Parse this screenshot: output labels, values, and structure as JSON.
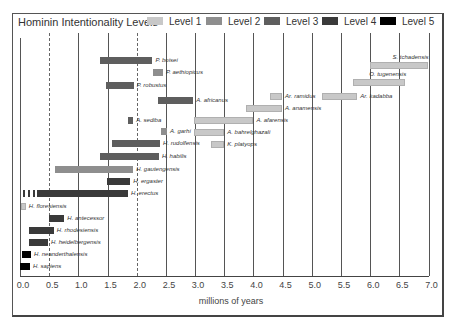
{
  "chart_data": {
    "type": "bar",
    "subtype": "horizontal-range (timeline)",
    "title": "Hominin Intentionality Levels",
    "xlabel": "millions of years",
    "ylabel": "",
    "xlim": [
      0.0,
      7.0
    ],
    "x_ticks": [
      "0.0",
      "0.5",
      "1.0",
      "1.5",
      "2.0",
      "2.5",
      "3.0",
      "3.5",
      "4.0",
      "4.5",
      "5.0",
      "5.5",
      "6.0",
      "6.5",
      "7.0"
    ],
    "grid": "vertical lines at each 0.5 Ma",
    "legend": [
      {
        "label": "Level 1",
        "color": "#c8c8c8"
      },
      {
        "label": "Level 2",
        "color": "#8e8e8e"
      },
      {
        "label": "Level 3",
        "color": "#5e5e5e"
      },
      {
        "label": "Level 4",
        "color": "#3a3a3a"
      },
      {
        "label": "Level 5",
        "color": "#000000"
      }
    ],
    "legend_position": "top, inline with title",
    "series": [
      {
        "name": "S. tchadensis",
        "start": 6.0,
        "end": 7.0,
        "level": 1
      },
      {
        "name": "P. boisei",
        "start": 1.37,
        "end": 2.27,
        "level": 3
      },
      {
        "name": "P. aethiopicus",
        "start": 2.28,
        "end": 2.45,
        "level": 2
      },
      {
        "name": "O. tugenensis",
        "start": 5.7,
        "end": 6.6,
        "level": 1
      },
      {
        "name": "P. robustus",
        "start": 1.47,
        "end": 1.95,
        "level": 3
      },
      {
        "name": "Ar. kadabba",
        "start": 5.18,
        "end": 5.78,
        "level": 1
      },
      {
        "name": "Ar. ramidus",
        "start": 4.29,
        "end": 4.49,
        "level": 1
      },
      {
        "name": "A. africanus",
        "start": 2.37,
        "end": 2.97,
        "level": 3
      },
      {
        "name": "A. anamensis",
        "start": 3.87,
        "end": 4.49,
        "level": 1
      },
      {
        "name": "A. sediba",
        "start": 1.85,
        "end": 1.94,
        "level": 3
      },
      {
        "name": "A. afarensis",
        "start": 2.98,
        "end": 4.0,
        "level": 1
      },
      {
        "name": "A. garhi",
        "start": 2.42,
        "end": 2.52,
        "level": 2
      },
      {
        "name": "A. bahrelghazali",
        "start": 2.98,
        "end": 3.5,
        "level": 1
      },
      {
        "name": "H. rudolfensis",
        "start": 1.58,
        "end": 2.4,
        "level": 3
      },
      {
        "name": "K. platyops",
        "start": 3.28,
        "end": 3.5,
        "level": 1
      },
      {
        "name": "H. habilis",
        "start": 1.37,
        "end": 2.38,
        "level": 3
      },
      {
        "name": "H. gautengensis",
        "start": 0.6,
        "end": 1.94,
        "level": 2
      },
      {
        "name": "H. ergaster",
        "start": 1.49,
        "end": 1.89,
        "level": 4
      },
      {
        "name": "H. erectus",
        "start": 0.03,
        "end": 1.85,
        "level": 4,
        "dashed_start_until": 0.29
      },
      {
        "name": "H. floresiensis",
        "start": 0.02,
        "end": 0.1,
        "level": 1
      },
      {
        "name": "H. antecessor",
        "start": 0.5,
        "end": 0.76,
        "level": 4
      },
      {
        "name": "H. rhodesiensis",
        "start": 0.15,
        "end": 0.58,
        "level": 4
      },
      {
        "name": "H. heidelbergensis",
        "start": 0.15,
        "end": 0.48,
        "level": 4
      },
      {
        "name": "H. neanderthalensis",
        "start": 0.03,
        "end": 0.19,
        "level": 5
      },
      {
        "name": "H. sapiens",
        "start": 0.0,
        "end": 0.17,
        "level": 5
      }
    ]
  }
}
